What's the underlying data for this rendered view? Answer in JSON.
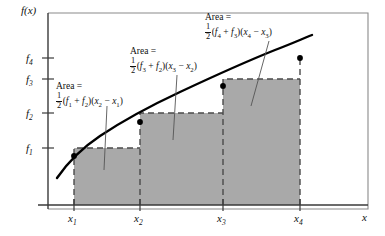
{
  "figure": {
    "type": "diagram",
    "axes": {
      "y_axis_label": "f(x)",
      "x_axis_label": "x",
      "y_tick_labels": [
        "f_1",
        "f_2",
        "f_3",
        "f_4"
      ],
      "x_tick_labels": [
        "x_1",
        "x_2",
        "x_3",
        "x_4"
      ]
    },
    "y_ticks": [
      {
        "id": "f1",
        "base": "f",
        "sub": "1"
      },
      {
        "id": "f2",
        "base": "f",
        "sub": "2"
      },
      {
        "id": "f3",
        "base": "f",
        "sub": "3"
      },
      {
        "id": "f4",
        "base": "f",
        "sub": "4"
      }
    ],
    "x_ticks": [
      {
        "id": "x1",
        "base": "x",
        "sub": "1"
      },
      {
        "id": "x2",
        "base": "x",
        "sub": "2"
      },
      {
        "id": "x3",
        "base": "x",
        "sub": "3"
      },
      {
        "id": "x4",
        "base": "x",
        "sub": "4"
      }
    ],
    "annotations": [
      {
        "id": "area-1",
        "line1": "Area =",
        "formula_plain": "1/2 (f_1 + f_2)(x_2 - x_1)",
        "fraction_num": "1",
        "fraction_den": "2",
        "open_paren": "(",
        "term_a_base": "f",
        "term_a_sub": "1",
        "plus": "+",
        "term_b_base": "f",
        "term_b_sub": "2",
        "mid_parens": ")(",
        "term_c_base": "x",
        "term_c_sub": "2",
        "minus": "−",
        "term_d_base": "x",
        "term_d_sub": "1",
        "close_paren": ")"
      },
      {
        "id": "area-2",
        "line1": "Area =",
        "formula_plain": "1/2 (f_3 + f_2)(x_3 - x_2)",
        "fraction_num": "1",
        "fraction_den": "2",
        "open_paren": "(",
        "term_a_base": "f",
        "term_a_sub": "3",
        "plus": "+",
        "term_b_base": "f",
        "term_b_sub": "2",
        "mid_parens": ")(",
        "term_c_base": "x",
        "term_c_sub": "3",
        "minus": "−",
        "term_d_base": "x",
        "term_d_sub": "2",
        "close_paren": ")"
      },
      {
        "id": "area-3",
        "line1": "Area =",
        "formula_plain": "1/2 (f_4 + f_3)(x_4 - x_3)",
        "fraction_num": "1",
        "fraction_den": "2",
        "open_paren": "(",
        "term_a_base": "f",
        "term_a_sub": "4",
        "plus": "+",
        "term_b_base": "f",
        "term_b_sub": "3",
        "mid_parens": ")(",
        "term_c_base": "x",
        "term_c_sub": "4",
        "minus": "−",
        "term_d_base": "x",
        "term_d_sub": "3",
        "close_paren": ")"
      }
    ],
    "colors": {
      "fill": "#a9a9a9",
      "stroke": "#4a4a4a",
      "curve": "#000000",
      "frame": "#6e6e6e",
      "text": "#111111"
    },
    "geometry": {
      "x_positions": {
        "x1": 74,
        "x2": 140,
        "x3": 223,
        "x4": 300
      },
      "y_positions": {
        "f1": 148,
        "f2": 113,
        "f3": 79,
        "f4": 58
      },
      "baseline_y": 205,
      "y_axis_x": 48
    }
  }
}
